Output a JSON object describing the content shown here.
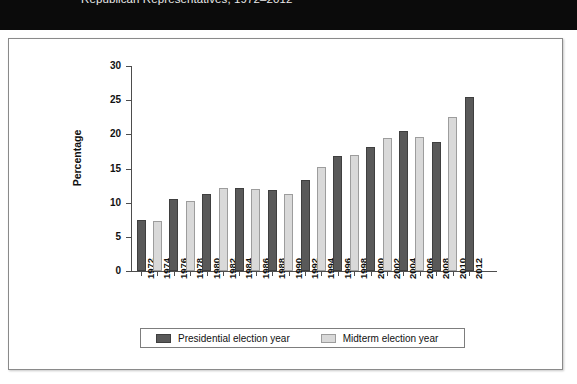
{
  "banner": {
    "title": "Republican Representatives, 1972–2012"
  },
  "chart_data": {
    "type": "bar",
    "title": "Republican Representatives, 1972–2012",
    "xlabel": "",
    "ylabel": "Percentage",
    "ylim": [
      0,
      30
    ],
    "yticks": [
      0,
      5,
      10,
      15,
      20,
      25,
      30
    ],
    "grid": false,
    "legend_position": "bottom",
    "categories": [
      "1972",
      "1974",
      "1976",
      "1978",
      "1980",
      "1982",
      "1984",
      "1986",
      "1988",
      "1990",
      "1992",
      "1994",
      "1996",
      "1998",
      "2000",
      "2002",
      "2004",
      "2006",
      "2008",
      "2010",
      "2012"
    ],
    "values": [
      7.4,
      7.3,
      10.6,
      10.2,
      11.3,
      12.1,
      12.2,
      12.0,
      11.8,
      11.2,
      13.3,
      15.2,
      16.8,
      17.0,
      18.2,
      19.4,
      20.5,
      19.6,
      18.9,
      22.5,
      25.5
    ],
    "series_of": [
      "presidential",
      "midterm",
      "presidential",
      "midterm",
      "presidential",
      "midterm",
      "presidential",
      "midterm",
      "presidential",
      "midterm",
      "presidential",
      "midterm",
      "presidential",
      "midterm",
      "presidential",
      "midterm",
      "presidential",
      "midterm",
      "presidential",
      "midterm",
      "presidential"
    ],
    "series": [
      {
        "name": "Presidential election year",
        "color": "#595959",
        "points": [
          {
            "x": "1972",
            "y": 7.4
          },
          {
            "x": "1976",
            "y": 10.6
          },
          {
            "x": "1980",
            "y": 11.3
          },
          {
            "x": "1984",
            "y": 12.2
          },
          {
            "x": "1988",
            "y": 11.8
          },
          {
            "x": "1992",
            "y": 13.3
          },
          {
            "x": "1996",
            "y": 16.8
          },
          {
            "x": "2000",
            "y": 18.2
          },
          {
            "x": "2004",
            "y": 20.5
          },
          {
            "x": "2008",
            "y": 18.9
          },
          {
            "x": "2012",
            "y": 25.5
          }
        ]
      },
      {
        "name": "Midterm election year",
        "color": "#d9d9d9",
        "points": [
          {
            "x": "1974",
            "y": 7.3
          },
          {
            "x": "1978",
            "y": 10.2
          },
          {
            "x": "1982",
            "y": 12.1
          },
          {
            "x": "1986",
            "y": 12.0
          },
          {
            "x": "1990",
            "y": 11.2
          },
          {
            "x": "1994",
            "y": 15.2
          },
          {
            "x": "1998",
            "y": 17.0
          },
          {
            "x": "2002",
            "y": 19.4
          },
          {
            "x": "2006",
            "y": 19.6
          },
          {
            "x": "2010",
            "y": 22.5
          }
        ]
      }
    ]
  },
  "legend": {
    "entries": [
      {
        "label": "Presidential election year",
        "color": "#595959"
      },
      {
        "label": "Midterm election year",
        "color": "#d9d9d9"
      }
    ]
  }
}
